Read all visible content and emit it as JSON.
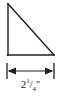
{
  "figure": {
    "name": "right-triangle-with-base-dimension",
    "background_color": "#ffffff",
    "stroke_color": "#231f20",
    "stroke_width": 1.4,
    "shape": {
      "type": "right-triangle",
      "right_angle_corner": "bottom-left",
      "vertices": {
        "apex_top_left": [
          8,
          4
        ],
        "corner_bottom_left": [
          8,
          55
        ],
        "corner_bottom_right": [
          54,
          55
        ]
      },
      "legs": {
        "vertical_left": {
          "from": [
            8,
            4
          ],
          "to": [
            8,
            55
          ]
        },
        "horizontal_bottom": {
          "from": [
            8,
            55
          ],
          "to": [
            54,
            55
          ]
        }
      },
      "hypotenuse": {
        "from": [
          8,
          4
        ],
        "to": [
          54,
          55
        ]
      }
    },
    "dimension": {
      "measures": "base",
      "orientation": "horizontal",
      "arrow_line_y": 71,
      "arrow_from_x": 9,
      "arrow_to_x": 53,
      "extension_ticks": [
        {
          "x": 7,
          "y_top": 63,
          "y_bottom": 79
        },
        {
          "x": 54,
          "y_top": 63,
          "y_bottom": 79
        }
      ],
      "label": {
        "full_text": "2 1/4\"",
        "whole_number": "2",
        "fraction_numerator": "1",
        "fraction_slash": "/",
        "fraction_denominator": "4",
        "unit_symbol": "\""
      }
    }
  }
}
